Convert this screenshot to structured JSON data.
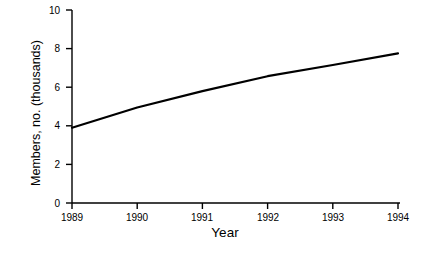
{
  "chart_data": {
    "type": "line",
    "title": "",
    "xlabel": "Year",
    "ylabel": "Members, no. (thousands)",
    "x": [
      1989,
      1990,
      1991,
      1992,
      1993,
      1994
    ],
    "xticklabels": [
      "1989",
      "1990",
      "1991",
      "1992",
      "1993",
      "1994"
    ],
    "yticklabels": [
      "0",
      "2",
      "4",
      "6",
      "8",
      "10"
    ],
    "yticks": [
      0,
      2,
      4,
      6,
      8,
      10
    ],
    "xlim": [
      1989,
      1994
    ],
    "ylim": [
      0,
      10
    ],
    "grid": false,
    "legend": false,
    "series": [
      {
        "name": "Members",
        "values": [
          3.9,
          4.95,
          5.8,
          6.57,
          7.15,
          7.75
        ],
        "color": "#000000",
        "linewidth": 2.2,
        "marker": "none"
      }
    ]
  },
  "axes": {
    "tick_color": "#000000",
    "spine_color": "#000000",
    "background": "#ffffff"
  }
}
